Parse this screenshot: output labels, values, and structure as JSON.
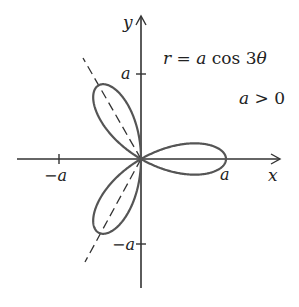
{
  "figure": {
    "equation": "r = a cos 3θ",
    "equation_parts": {
      "r": "r",
      "eq": " = ",
      "a": "a",
      "cos": " cos 3",
      "theta": "θ"
    },
    "condition": "a > 0",
    "condition_parts": {
      "a": "a",
      "rest": " > 0"
    },
    "x_axis_label": "x",
    "y_axis_label": "y",
    "tick_labels": {
      "x_pos": "a",
      "x_neg": "−a",
      "y_pos": "a",
      "y_neg": "−a"
    },
    "colors": {
      "axes": "#333333",
      "curve": "#555555",
      "dashed": "#333333",
      "background": "#ffffff"
    }
  },
  "chart_data": {
    "type": "line",
    "subtitle": "three-petaled rose",
    "xlabel": "x",
    "ylabel": "y",
    "x_ticks": [
      "−a",
      "a"
    ],
    "y_ticks": [
      "−a",
      "a"
    ],
    "xlim": [
      "-1.45a",
      "1.65a"
    ],
    "ylim": [
      "-1.5a",
      "1.7a"
    ],
    "grid": false,
    "legend": "none",
    "series": [
      {
        "name": "rose r = a cos 3θ",
        "style": "solid",
        "petal_directions_deg": [
          0,
          120,
          240
        ],
        "petal_length": "a"
      },
      {
        "name": "petal axes",
        "style": "dashed",
        "directions_deg": [
          120,
          300
        ]
      }
    ],
    "annotations": [
      "r = a cos 3θ",
      "a > 0"
    ]
  }
}
